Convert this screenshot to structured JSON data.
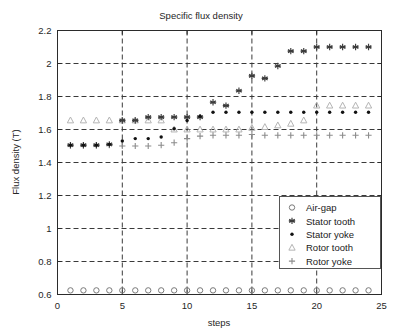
{
  "chart_data": {
    "type": "scatter",
    "title": "Specific flux density",
    "xlabel": "steps",
    "ylabel": "Flux density (T)",
    "xlim": [
      0,
      25
    ],
    "ylim": [
      0.6,
      2.2
    ],
    "xticks": [
      0,
      5,
      10,
      15,
      20,
      25
    ],
    "xticklabels": [
      "0",
      "5",
      "10",
      "15",
      "20",
      "25"
    ],
    "yticks": [
      0.6,
      0.8,
      1.0,
      1.2,
      1.4,
      1.6,
      1.8,
      2.0,
      2.2
    ],
    "yticklabels": [
      "0.6",
      "0.8",
      "1",
      "1.2",
      "1.4",
      "1.6",
      "1.8",
      "2",
      "2.2"
    ],
    "grid": true,
    "grid_style": "dashed",
    "legend_position": "lower right",
    "x": [
      1,
      2,
      3,
      4,
      5,
      6,
      7,
      8,
      9,
      10,
      11,
      12,
      13,
      14,
      15,
      16,
      17,
      18,
      19,
      20,
      21,
      22,
      23,
      24
    ],
    "series": [
      {
        "name": "Air-gap",
        "marker": "circle",
        "color": "#7a7a7a",
        "values": [
          0.625,
          0.625,
          0.625,
          0.625,
          0.625,
          0.625,
          0.625,
          0.625,
          0.625,
          0.625,
          0.625,
          0.625,
          0.625,
          0.625,
          0.625,
          0.625,
          0.625,
          0.625,
          0.625,
          0.625,
          0.625,
          0.625,
          0.625,
          0.625
        ]
      },
      {
        "name": "Stator tooth",
        "marker": "asterisk",
        "color": "#3c3c3c",
        "values": [
          1.505,
          1.505,
          1.505,
          1.51,
          1.655,
          1.655,
          1.675,
          1.675,
          1.675,
          1.675,
          1.675,
          1.765,
          1.745,
          1.835,
          1.925,
          1.91,
          1.985,
          2.075,
          2.075,
          2.1,
          2.1,
          2.1,
          2.1,
          2.1
        ]
      },
      {
        "name": "Stator yoke",
        "marker": "dot",
        "color": "#111111",
        "values": [
          1.505,
          1.505,
          1.505,
          1.51,
          1.53,
          1.545,
          1.545,
          1.555,
          1.605,
          1.655,
          1.68,
          1.705,
          1.705,
          1.705,
          1.705,
          1.705,
          1.705,
          1.705,
          1.705,
          1.705,
          1.705,
          1.705,
          1.705,
          1.705
        ]
      },
      {
        "name": "Rotor tooth",
        "marker": "triangle",
        "color": "#b4b4b4",
        "values": [
          1.655,
          1.655,
          1.655,
          1.655,
          1.655,
          1.655,
          1.655,
          1.655,
          1.6,
          1.6,
          1.6,
          1.6,
          1.6,
          1.6,
          1.61,
          1.615,
          1.625,
          1.635,
          1.655,
          1.745,
          1.745,
          1.745,
          1.745,
          1.745
        ]
      },
      {
        "name": "Rotor yoke",
        "marker": "plus",
        "color": "#8c8c8c",
        "values": [
          1.505,
          1.505,
          1.505,
          1.505,
          1.5,
          1.5,
          1.5,
          1.505,
          1.52,
          1.545,
          1.56,
          1.565,
          1.565,
          1.565,
          1.57,
          1.565,
          1.565,
          1.565,
          1.565,
          1.565,
          1.565,
          1.565,
          1.565,
          1.565
        ]
      }
    ]
  },
  "legend": {
    "items": [
      {
        "label": "Air-gap",
        "marker": "circle"
      },
      {
        "label": "Stator tooth",
        "marker": "asterisk"
      },
      {
        "label": "Stator yoke",
        "marker": "dot"
      },
      {
        "label": "Rotor tooth",
        "marker": "triangle"
      },
      {
        "label": "Rotor yoke",
        "marker": "plus"
      }
    ]
  },
  "colors": {
    "axis": "#2b2b2b",
    "grid": "#3a3a3a",
    "background": "#ffffff",
    "text": "#262626"
  }
}
